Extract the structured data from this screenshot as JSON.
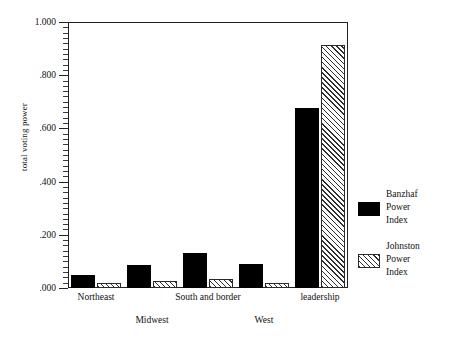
{
  "chart_data": {
    "type": "bar",
    "title": "",
    "xlabel": "",
    "ylabel": "total voting power",
    "ylim": [
      0,
      1.0
    ],
    "grid": false,
    "legend_position": "right",
    "categories": [
      "Northeast",
      "Midwest",
      "South and border",
      "West",
      "leadership"
    ],
    "y_tick_labels": [
      "1.000",
      ".800",
      ".600",
      ".400",
      ".200",
      ".000"
    ],
    "y_tick_values": [
      1.0,
      0.8,
      0.6,
      0.4,
      0.2,
      0.0
    ],
    "minor_tick_step": 0.02,
    "series": [
      {
        "name": "Banzhaf Power Index",
        "style": "solid-black",
        "color": "#000000",
        "values": [
          0.048,
          0.088,
          0.131,
          0.09,
          0.677
        ]
      },
      {
        "name": "Johnston Power Index",
        "style": "diagonal-hatch",
        "color": "#2f2f2f",
        "values": [
          0.017,
          0.025,
          0.034,
          0.02,
          0.912
        ]
      }
    ]
  },
  "legend": {
    "entries": [
      {
        "line1": "Banzhaf",
        "line2": "Power",
        "line3": "Index",
        "swatch": "solid"
      },
      {
        "line1": "Johnston",
        "line2": "Power",
        "line3": "Index",
        "swatch": "hatch"
      }
    ]
  },
  "axis": {
    "y_title": "total voting power"
  }
}
